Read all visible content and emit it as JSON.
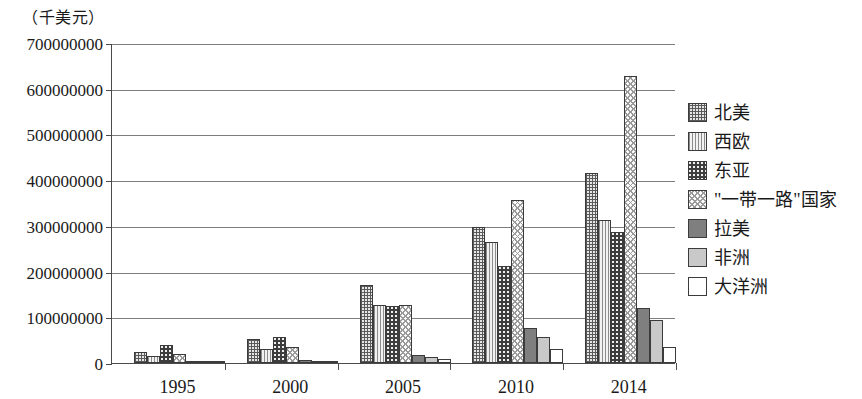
{
  "caption": "（千美元）",
  "chart_data": {
    "type": "bar",
    "title": "",
    "subtitle": "",
    "xlabel": "",
    "ylabel": "（千美元）",
    "unit_note": "（千美元）",
    "grid": true,
    "legend_position": "right",
    "ylim": [
      0,
      700000000
    ],
    "ytick_interval": 100000000,
    "ytick_labels": [
      "0",
      "100000000",
      "200000000",
      "300000000",
      "400000000",
      "500000000",
      "600000000",
      "700000000"
    ],
    "ytick_values": [
      0,
      100000000,
      200000000,
      300000000,
      400000000,
      500000000,
      600000000,
      700000000
    ],
    "categories": [
      "1995",
      "2000",
      "2005",
      "2010",
      "2014"
    ],
    "series": [
      {
        "name": "北美",
        "pattern": "crosshatch-dense",
        "values": [
          25000000,
          52000000,
          170000000,
          298000000,
          415000000
        ]
      },
      {
        "name": "西欧",
        "pattern": "vertical-lines",
        "values": [
          15000000,
          30000000,
          127000000,
          265000000,
          312000000
        ]
      },
      {
        "name": "东亚",
        "pattern": "dots-dark",
        "values": [
          40000000,
          58000000,
          125000000,
          213000000,
          287000000
        ]
      },
      {
        "name": "\"一带一路\"国家",
        "pattern": "check-light",
        "values": [
          20000000,
          35000000,
          127000000,
          357000000,
          628000000
        ]
      },
      {
        "name": "拉美",
        "pattern": "solid-dark",
        "values": [
          3000000,
          6000000,
          17000000,
          76000000,
          120000000
        ]
      },
      {
        "name": "非洲",
        "pattern": "solid-light",
        "values": [
          2000000,
          4000000,
          13000000,
          57000000,
          95000000
        ]
      },
      {
        "name": "大洋洲",
        "pattern": "white",
        "values": [
          1500000,
          3000000,
          9000000,
          30000000,
          35000000
        ]
      }
    ]
  },
  "legend": {
    "items": [
      {
        "label": "北美",
        "swatch": "crosshatch-dense-swatch"
      },
      {
        "label": "西欧",
        "swatch": "vertical-lines-swatch"
      },
      {
        "label": "东亚",
        "swatch": "dots-dark-swatch"
      },
      {
        "label": "\"一带一路\"国家",
        "swatch": "check-light-swatch"
      },
      {
        "label": "拉美",
        "swatch": "solid-dark-swatch"
      },
      {
        "label": "非洲",
        "swatch": "solid-light-swatch"
      },
      {
        "label": "大洋洲",
        "swatch": "white-swatch"
      }
    ]
  }
}
